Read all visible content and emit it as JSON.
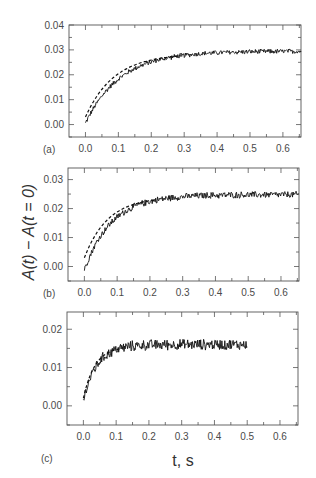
{
  "figure": {
    "y_axis_title": "A(t) − A(t = 0)",
    "x_axis_title": "t, s",
    "colors": {
      "data": "#111111",
      "fit": "#111111",
      "axes": "#555555",
      "text": "#4a4a4a"
    }
  },
  "chart_data": [
    {
      "type": "line",
      "panel_label": "(a)",
      "title": "",
      "xlabel": "t, s",
      "ylabel": "A(t) − A(t = 0)",
      "xlim": [
        -0.05,
        0.655
      ],
      "ylim": [
        -0.005,
        0.04
      ],
      "x_ticks": [
        "0.0",
        "0.1",
        "0.2",
        "0.3",
        "0.4",
        "0.5",
        "0.6"
      ],
      "y_ticks": [
        "0.00",
        "0.01",
        "0.02",
        "0.03",
        "0.04"
      ],
      "grid": false,
      "series": [
        {
          "name": "experimental (noisy)",
          "style": "solid",
          "t_start": 0.0,
          "t_end": 0.655,
          "plateau": 0.0295,
          "rate_per_s": 9.5,
          "y0": 0.0005,
          "noise": 0.0011,
          "sample_points": {
            "t": [
              0.0,
              0.05,
              0.1,
              0.15,
              0.2,
              0.3,
              0.4,
              0.5,
              0.6,
              0.65
            ],
            "y": [
              0.001,
              0.012,
              0.018,
              0.022,
              0.025,
              0.027,
              0.0285,
              0.029,
              0.03,
              0.03
            ]
          }
        },
        {
          "name": "fit (dashed)",
          "style": "dashed",
          "t_start": 0.0,
          "t_end": 0.3,
          "plateau": 0.0285,
          "rate_per_s": 11.5,
          "y0": 0.003,
          "sample_points": {
            "t": [
              0.0,
              0.05,
              0.1,
              0.15,
              0.2,
              0.25,
              0.3
            ],
            "y": [
              0.003,
              0.0145,
              0.0205,
              0.024,
              0.026,
              0.027,
              0.0278
            ]
          }
        }
      ]
    },
    {
      "type": "line",
      "panel_label": "(b)",
      "title": "",
      "xlabel": "t, s",
      "ylabel": "A(t) − A(t = 0)",
      "xlim": [
        -0.05,
        0.655
      ],
      "ylim": [
        -0.005,
        0.034
      ],
      "x_ticks": [
        "0.0",
        "0.1",
        "0.2",
        "0.3",
        "0.4",
        "0.5",
        "0.6"
      ],
      "y_ticks": [
        "0.00",
        "0.01",
        "0.02",
        "0.03"
      ],
      "grid": false,
      "series": [
        {
          "name": "experimental (noisy)",
          "style": "solid",
          "t_start": 0.0,
          "t_end": 0.655,
          "plateau": 0.0248,
          "rate_per_s": 12.0,
          "y0": -0.001,
          "noise": 0.0013,
          "sample_points": {
            "t": [
              0.0,
              0.05,
              0.1,
              0.15,
              0.2,
              0.3,
              0.4,
              0.5,
              0.6,
              0.65
            ],
            "y": [
              0.0,
              0.011,
              0.017,
              0.021,
              0.023,
              0.024,
              0.0245,
              0.025,
              0.025,
              0.025
            ]
          }
        },
        {
          "name": "fit (dashed)",
          "style": "dashed",
          "t_start": 0.0,
          "t_end": 0.22,
          "plateau": 0.024,
          "rate_per_s": 14.0,
          "y0": 0.003,
          "sample_points": {
            "t": [
              0.0,
              0.05,
              0.1,
              0.15,
              0.2
            ],
            "y": [
              0.003,
              0.014,
              0.019,
              0.022,
              0.023
            ]
          }
        }
      ]
    },
    {
      "type": "line",
      "panel_label": "(c)",
      "title": "",
      "xlabel": "t, s",
      "ylabel": "A(t) − A(t = 0)",
      "xlim": [
        -0.05,
        0.655
      ],
      "ylim": [
        -0.005,
        0.0245
      ],
      "x_ticks": [
        "0.0",
        "0.1",
        "0.2",
        "0.3",
        "0.4",
        "0.5",
        "0.6"
      ],
      "y_ticks": [
        "0.00",
        "0.01",
        "0.02"
      ],
      "grid": false,
      "series": [
        {
          "name": "experimental (noisy)",
          "style": "solid",
          "t_start": 0.0,
          "t_end": 0.5,
          "plateau": 0.016,
          "rate_per_s": 24.0,
          "y0": 0.0015,
          "noise": 0.0016,
          "sample_points": {
            "t": [
              0.0,
              0.025,
              0.05,
              0.1,
              0.2,
              0.3,
              0.4,
              0.5
            ],
            "y": [
              0.002,
              0.009,
              0.012,
              0.015,
              0.016,
              0.016,
              0.016,
              0.016
            ]
          }
        },
        {
          "name": "fit (dashed)",
          "style": "dashed",
          "t_start": 0.0,
          "t_end": 0.12,
          "plateau": 0.0155,
          "rate_per_s": 28.0,
          "y0": 0.002,
          "sample_points": {
            "t": [
              0.0,
              0.025,
              0.05,
              0.075,
              0.1
            ],
            "y": [
              0.002,
              0.0095,
              0.013,
              0.0145,
              0.015
            ]
          }
        }
      ]
    }
  ]
}
